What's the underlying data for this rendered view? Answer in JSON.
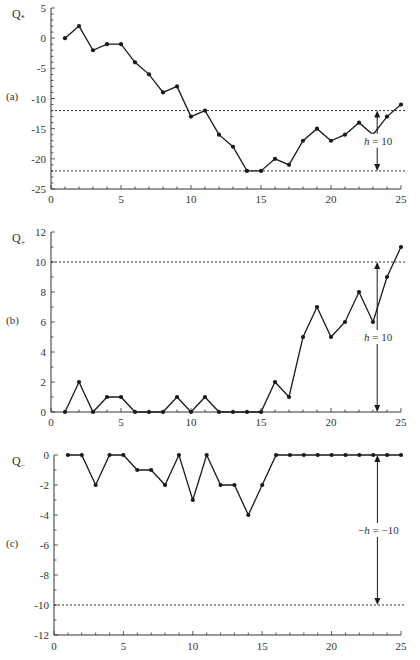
{
  "chart_data": [
    {
      "type": "line",
      "panel": "(a)",
      "ylabel": "Q*",
      "xlabel": "",
      "xlim": [
        0,
        25
      ],
      "ylim": [
        -25,
        5
      ],
      "x_ticks": [
        0,
        5,
        10,
        15,
        20,
        25
      ],
      "y_ticks": [
        5,
        0,
        -5,
        -10,
        -15,
        -20,
        -25
      ],
      "x": [
        1,
        2,
        3,
        4,
        5,
        6,
        7,
        8,
        9,
        10,
        11,
        12,
        13,
        14,
        15,
        16,
        17,
        18,
        19,
        20,
        21,
        22,
        23,
        24,
        25
      ],
      "values": [
        0,
        2,
        -2,
        -1,
        -1,
        -4,
        -6,
        -9,
        -8,
        -13,
        -12,
        -16,
        -18,
        -22,
        -22,
        -20,
        -21,
        -17,
        -15,
        -17,
        -16,
        -14,
        -16,
        -13,
        -11
      ],
      "reference_lines": [
        -12,
        -22
      ],
      "annotation": {
        "text": "h = 10",
        "x": 23.3,
        "from": -12,
        "to": -22
      },
      "grid": false
    },
    {
      "type": "line",
      "panel": "(b)",
      "ylabel": "Q+",
      "xlabel": "",
      "xlim": [
        0,
        25
      ],
      "ylim": [
        0,
        12
      ],
      "x_ticks": [
        0,
        5,
        10,
        15,
        20,
        25
      ],
      "y_ticks": [
        12,
        10,
        8,
        6,
        4,
        2,
        0
      ],
      "x": [
        1,
        2,
        3,
        4,
        5,
        6,
        7,
        8,
        9,
        10,
        11,
        12,
        13,
        14,
        15,
        16,
        17,
        18,
        19,
        20,
        21,
        22,
        23,
        24,
        25
      ],
      "values": [
        0,
        2,
        0,
        1,
        1,
        0,
        0,
        0,
        1,
        0,
        1,
        0,
        0,
        0,
        0,
        2,
        1,
        5,
        7,
        5,
        6,
        8,
        6,
        9,
        11
      ],
      "reference_lines": [
        10
      ],
      "annotation": {
        "text": "h = 10",
        "x": 23.3,
        "from": 10,
        "to": 0
      },
      "grid": false
    },
    {
      "type": "line",
      "panel": "(c)",
      "ylabel": "Q-",
      "xlabel": "",
      "xlim": [
        0,
        25
      ],
      "ylim": [
        -12,
        0
      ],
      "x_ticks": [
        0,
        5,
        10,
        15,
        20,
        25
      ],
      "y_ticks": [
        0,
        -2,
        -4,
        -6,
        -8,
        -10,
        -12
      ],
      "x": [
        1,
        2,
        3,
        4,
        5,
        6,
        7,
        8,
        9,
        10,
        11,
        12,
        13,
        14,
        15,
        16,
        17,
        18,
        19,
        20,
        21,
        22,
        23,
        24,
        25
      ],
      "values": [
        0,
        0,
        -2,
        0,
        0,
        -1,
        -1,
        -2,
        0,
        -3,
        0,
        -2,
        -2,
        -4,
        -2,
        0,
        0,
        0,
        0,
        0,
        0,
        0,
        0,
        0,
        0
      ],
      "reference_lines": [
        -10
      ],
      "annotation": {
        "text": "-h = -10",
        "x": 23.3,
        "from": 0,
        "to": -10
      },
      "grid": false
    }
  ],
  "panels": [
    {
      "label": "(a)",
      "ylabel_main": "Q",
      "ylabel_sub": "*",
      "annotation": "h = 10"
    },
    {
      "label": "(b)",
      "ylabel_main": "Q",
      "ylabel_sub": "+",
      "annotation": "h = 10"
    },
    {
      "label": "(c)",
      "ylabel_main": "Q",
      "ylabel_sub": "−",
      "annotation": "−h = −10"
    }
  ],
  "colors": {
    "line": "#1a1a1a",
    "axis": "#333333",
    "dash": "#333333"
  }
}
